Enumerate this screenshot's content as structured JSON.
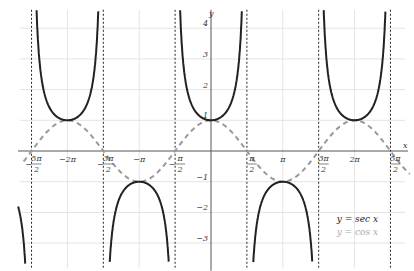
{
  "chart_data": {
    "type": "line",
    "title": "",
    "xlabel": "x",
    "ylabel": "y",
    "xlim": [
      -8.2,
      8.7
    ],
    "ylim": [
      -3.9,
      4.9
    ],
    "grid": true,
    "legend_position": "bottom-right",
    "x_ticks": [
      {
        "value": -7.854,
        "label": "-5π/2"
      },
      {
        "value": -6.283,
        "label": "-2π"
      },
      {
        "value": -4.712,
        "label": "-3π/2"
      },
      {
        "value": -3.1416,
        "label": "-π"
      },
      {
        "value": -1.5708,
        "label": "-π/2"
      },
      {
        "value": 1.5708,
        "label": "π/2"
      },
      {
        "value": 3.1416,
        "label": "π"
      },
      {
        "value": 4.712,
        "label": "3π/2"
      },
      {
        "value": 6.283,
        "label": "2π"
      },
      {
        "value": 7.854,
        "label": "5π/2"
      }
    ],
    "y_ticks": [
      -3,
      -2,
      -1,
      1,
      2,
      3,
      4
    ],
    "asymptotes": [
      "-5π/2",
      "-3π/2",
      "-π/2",
      "π/2",
      "3π/2",
      "5π/2"
    ],
    "series": [
      {
        "name": "y = sec x",
        "function": "sec(x)",
        "style": "solid",
        "color": "#222222"
      },
      {
        "name": "y = cos x",
        "function": "cos(x)",
        "style": "dashed",
        "color": "#999999"
      }
    ]
  },
  "legend": {
    "sec_label": "y = sec x",
    "cos_label": "y = cos x"
  },
  "axes": {
    "x_label": "x",
    "y_label": "y"
  }
}
